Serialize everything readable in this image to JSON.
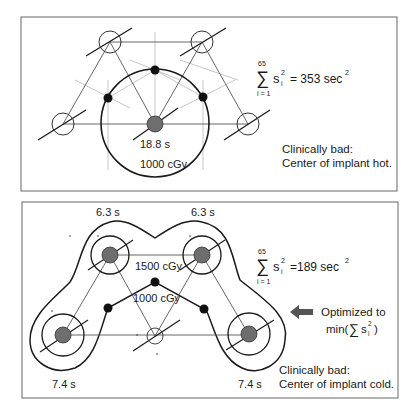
{
  "panels": [
    {
      "id": "top",
      "source_time_label": "18.8 s",
      "isodose_label": "1000 cGy",
      "formula": {
        "upper": "65",
        "lower": "i = 1",
        "term": "s",
        "sub": "i",
        "sup": "2",
        "result": "= 353 sec",
        "result_sup": "2"
      },
      "note_line1": "Clinically bad:",
      "note_line2": "Center of implant hot."
    },
    {
      "id": "bottom",
      "time_labels": {
        "top_left": "6.3 s",
        "top_right": "6.3 s",
        "bottom_left": "7.4 s",
        "bottom_right": "7.4 s"
      },
      "isodose_outer_label": "1500 cGy",
      "isodose_inner_label": "1000 cGy",
      "formula": {
        "upper": "65",
        "lower": "i = 1",
        "term": "s",
        "sub": "i",
        "sup": "2",
        "result": "=189 sec",
        "result_sup": "2"
      },
      "arrow_text_line1": "Optimized to",
      "arrow_text_line2_prefix": "min(",
      "arrow_text_sigma": "∑",
      "arrow_text_term": "s",
      "arrow_text_sub": "i",
      "arrow_text_sup": "2",
      "arrow_text_line2_suffix": ")",
      "note_line1": "Clinically bad:",
      "note_line2": "Center of implant cold."
    }
  ],
  "colors": {
    "line": "#1a1a1a",
    "thin_line": "#555555",
    "faint_line": "#b0b0b0",
    "source_fill": "#6e6e6e",
    "dot_fill": "#111111",
    "border": "#666666"
  }
}
